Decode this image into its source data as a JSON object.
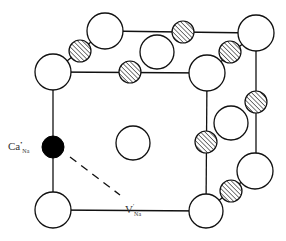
{
  "diagram": {
    "type": "NaCl rock-salt unit cell with defect pair",
    "labels": {
      "dopant": {
        "base": "Ca",
        "sup": "•",
        "sub": "Na"
      },
      "vacancy": {
        "base": "V",
        "sup": "'",
        "sub": "Na"
      }
    },
    "legend_implicit": {
      "open_circle": "anion site (Cl)",
      "hatched_circle": "cation site (Na)",
      "filled_circle": "substitutional Ca on Na site"
    },
    "colors": {
      "line": "#111111",
      "fill_open": "#ffffff",
      "fill_dopant": "#000000",
      "hatch": "#333333"
    }
  }
}
